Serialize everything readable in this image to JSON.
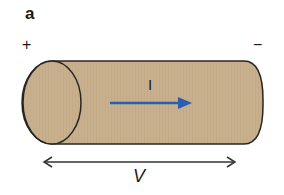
{
  "figure": {
    "panel_label": "a",
    "terminals": {
      "positive": "+",
      "negative": "−"
    },
    "current_label": "I",
    "voltage_label": "V"
  },
  "colors": {
    "cylinder_fill": "#c8b08e",
    "outline": "#2a2420",
    "current_arrow": "#2a5fb0",
    "voltage_arrow": "#333333"
  }
}
